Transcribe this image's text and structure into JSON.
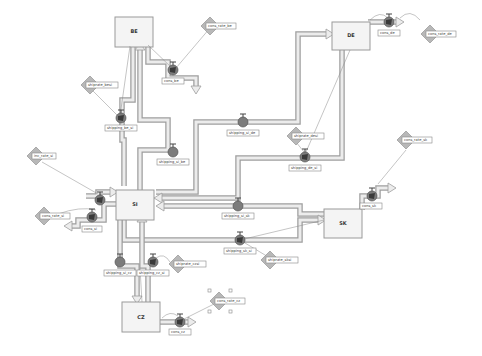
{
  "diagram": {
    "type": "system-dynamics-stock-flow",
    "background": "#ffffff",
    "colors": {
      "pipe": "#9e9e9e",
      "pipe_fill": "#ececec",
      "stock_fill": "#f4f4f4",
      "valve": "#7c7c7c",
      "aux": "#b8b8b8"
    },
    "stocks": [
      {
        "id": "BE",
        "label": "BE"
      },
      {
        "id": "DE",
        "label": "DE"
      },
      {
        "id": "SI",
        "label": "SI"
      },
      {
        "id": "SK",
        "label": "SK"
      },
      {
        "id": "CZ",
        "label": "CZ"
      }
    ],
    "flows": {
      "cons_be": "cons_be",
      "cons_de": "cons_de",
      "cons_si": "cons_si",
      "cons_sk": "cons_sk",
      "cons_cz": "cons_cz",
      "shipping_be_si": "shipping_be_si",
      "shipping_si_be": "shipping_si_be",
      "shipping_si_de": "shipping_si_de",
      "shipping_de_si": "shipping_de_si",
      "shipping_si_sk": "shipping_si_sk",
      "shipping_sk_si": "shipping_sk_si",
      "shipping_si_cz": "shipping_si_cz",
      "shipping_cz_si": "shipping_cz_si",
      "inc_si": ""
    },
    "auxiliaries": {
      "cons_rate_be": "cons_rate_be",
      "cons_rate_de": "cons_rate_de",
      "cons_rate_si": "cons_rate_si",
      "cons_rate_sk": "cons_rate_sk",
      "cons_rate_cz": "cons_rate_cz",
      "inc_rate_si": "inc_rate_si",
      "shiprate_besi": "shiprate_besi",
      "shiprate_desi": "shiprate_desi",
      "shiprate_sksi": "shiprate_sksi",
      "shiprate_czsi": "shiprate_czsi"
    }
  }
}
